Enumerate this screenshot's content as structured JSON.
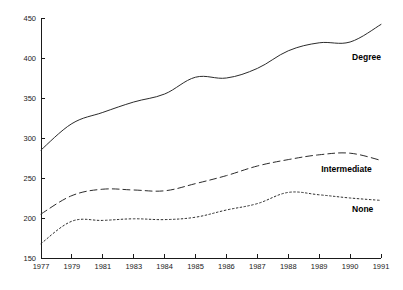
{
  "chart_data": {
    "type": "line",
    "title": "",
    "subtitle": "",
    "xlabel": "",
    "ylabel": "",
    "x": [
      1977,
      1979,
      1981,
      1983,
      1984,
      1985,
      1986,
      1987,
      1988,
      1989,
      1990,
      1991
    ],
    "categories": [
      "1977",
      "1979",
      "1981",
      "1983",
      "1984",
      "1985",
      "1986",
      "1987",
      "1988",
      "1989",
      "1990",
      "1991"
    ],
    "xlim": [
      1977,
      1991
    ],
    "ylim": [
      150,
      450
    ],
    "yticks": [
      150,
      200,
      250,
      300,
      350,
      400,
      450
    ],
    "yticklabels": [
      "150",
      "200",
      "250",
      "300",
      "350",
      "400",
      "450"
    ],
    "xticklabels": [
      "1977",
      "1979",
      "1981",
      "1983",
      "1984",
      "1985",
      "1986",
      "1987",
      "1988",
      "1989",
      "1990",
      "1991"
    ],
    "grid": false,
    "legend_position": "inline-right",
    "series": [
      {
        "name": "Degree",
        "label": "Degree",
        "style": "solid",
        "color": "#2b2b2b",
        "values": [
          285,
          318,
          332,
          345,
          355,
          376,
          375,
          387,
          409,
          419,
          420,
          442
        ]
      },
      {
        "name": "Intermediate",
        "label": "Intermediate",
        "style": "dashed",
        "color": "#2b2b2b",
        "values": [
          205,
          228,
          236,
          235,
          234,
          243,
          253,
          265,
          273,
          279,
          281,
          272
        ]
      },
      {
        "name": "None",
        "label": "None",
        "style": "dotted",
        "color": "#2b2b2b",
        "values": [
          168,
          196,
          197,
          199,
          198,
          201,
          210,
          218,
          232,
          229,
          225,
          222
        ]
      }
    ],
    "annotations": [
      {
        "text": "Degree",
        "series": "Degree",
        "x": 1990,
        "y": 398
      },
      {
        "text": "Intermediate",
        "series": "Intermediate",
        "x": 1989,
        "y": 258
      },
      {
        "text": "None",
        "series": "None",
        "x": 1990,
        "y": 208
      }
    ],
    "colors": {
      "axis": "#1a1a1a",
      "line": "#2b2b2b",
      "background": "#ffffff",
      "text": "#1a1a1a"
    }
  }
}
